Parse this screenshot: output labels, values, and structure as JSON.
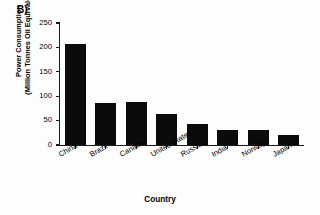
{
  "panel": {
    "label": "B)"
  },
  "chart_data": {
    "type": "bar",
    "title": "",
    "xlabel": "Country",
    "ylabel": "Power Consumption (Million Tonnes Oil Equivalent)",
    "ylabel_line1": "Power Consumption",
    "ylabel_line2": "(Million Tonnes Oil Equivalent)",
    "categories": [
      "China",
      "Brazil",
      "Canada",
      "United States",
      "Russia",
      "India",
      "Norway",
      "Japan"
    ],
    "values": [
      207,
      87,
      89,
      63,
      43,
      31,
      31,
      20
    ],
    "ylim": [
      0,
      250
    ],
    "yticks": [
      250,
      200,
      150,
      100,
      50,
      0
    ],
    "ytick_labels": [
      "250",
      "200",
      "150",
      "100",
      "50",
      "0"
    ],
    "grid": false,
    "legend": false,
    "bar_color": "#0b0b0b",
    "axis_color": "#1a1a1a",
    "background": "#fdfdfd",
    "xtick_label_rotation": -30
  }
}
